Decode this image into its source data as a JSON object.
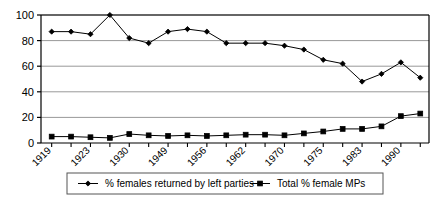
{
  "chart_data": {
    "type": "line",
    "title": "",
    "subtitle": "",
    "xlabel": "",
    "ylabel": "",
    "ylim": [
      0,
      100
    ],
    "yticks": [
      0,
      20,
      40,
      60,
      80,
      100
    ],
    "grid": true,
    "legend_position": "bottom",
    "x": [
      "1919",
      "1922",
      "1923",
      "1924",
      "1929",
      "1931",
      "1935",
      "1945",
      "1950",
      "1951",
      "1955",
      "1959",
      "1964",
      "1966",
      "1970",
      "1974",
      "1979",
      "1983",
      "1987",
      "1992"
    ],
    "xtick_labels": [
      "1919",
      "",
      "1923",
      "",
      "1930",
      "",
      "1949",
      "",
      "1956",
      "",
      "1962",
      "",
      "1970",
      "",
      "1975",
      "",
      "1983",
      "",
      "1990",
      ""
    ],
    "xtick_labels_visible": [
      "1919",
      "1923",
      "1930",
      "1949",
      "1956",
      "1962",
      "1970",
      "1975",
      "1983",
      "1990"
    ],
    "series": [
      {
        "name": "% females returned by left parties",
        "marker": "diamond",
        "color": "#000000",
        "values": [
          87,
          87,
          85,
          100,
          82,
          78,
          87,
          89,
          87,
          78,
          78,
          78,
          76,
          73,
          65,
          62,
          48,
          54,
          63,
          51
        ]
      },
      {
        "name": "Total % female MPs",
        "marker": "square",
        "color": "#000000",
        "values": [
          5,
          5,
          4.5,
          4,
          7,
          6,
          5.5,
          6,
          5.5,
          6,
          6.5,
          6.5,
          6,
          7.5,
          9,
          11,
          11,
          13,
          21,
          23
        ]
      }
    ]
  },
  "legend": {
    "items": [
      {
        "label": "% females returned by left parties",
        "marker": "diamond"
      },
      {
        "label": "Total % female MPs",
        "marker": "square"
      }
    ]
  },
  "axis": {
    "y_labels": [
      "100",
      "80",
      "60",
      "40",
      "20",
      "0"
    ]
  },
  "colors": {
    "line": "#000000",
    "grid": "#999999",
    "axis": "#000000",
    "background": "#ffffff",
    "legend_border": "#555555"
  }
}
